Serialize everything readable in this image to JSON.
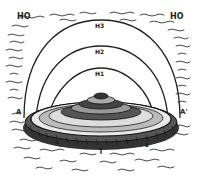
{
  "diagram": {
    "type": "cosmological illustration",
    "labels": {
      "outer_water_left": "HO",
      "outer_water_right": "HO",
      "dome_outer": "H3",
      "dome_middle": "H2",
      "dome_inner": "H1",
      "edge_left": "A",
      "edge_right": "A'",
      "under_left": "P",
      "under_right": "B"
    },
    "colors": {
      "ink": "#222222",
      "paper": "#ffffff"
    }
  }
}
